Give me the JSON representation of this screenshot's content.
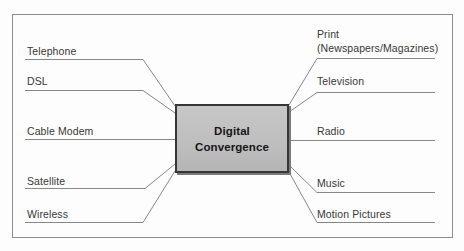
{
  "diagram": {
    "center_box": {
      "line1": "Digital",
      "line2": "Convergence"
    },
    "left_items": [
      {
        "label": "Telephone"
      },
      {
        "label": "DSL"
      },
      {
        "label": "Cable Modem"
      },
      {
        "label": "Satellite"
      },
      {
        "label": "Wireless"
      }
    ],
    "right_items": [
      {
        "label": "Print",
        "label2": "(Newspapers/Magazines)"
      },
      {
        "label": "Television"
      },
      {
        "label": "Radio"
      },
      {
        "label": "Music"
      },
      {
        "label": "Motion Pictures"
      }
    ],
    "colors": {
      "background": "#fdfdfd",
      "frame_border": "#8e8e8e",
      "connector_line": "#878787",
      "box_fill": "#c0c0c0",
      "box_border": "#363636",
      "box_shadow": "#7a7a7a",
      "label_text": "#383838",
      "box_text": "#161616"
    }
  }
}
